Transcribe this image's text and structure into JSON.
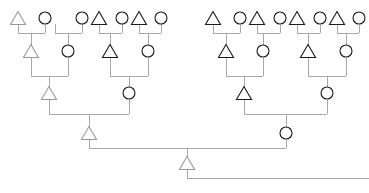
{
  "diagram": {
    "type": "pedigree-family-tree",
    "canvas": {
      "width": 369,
      "height": 193,
      "background": "#ffffff"
    },
    "style": {
      "line_color": "#a8a8a8",
      "node_stroke_dark": "#1a1a1a",
      "node_stroke_light": "#9a9a9a",
      "node_fill": "#ffffff",
      "circle_radius": 6,
      "triangle_size": 13,
      "line_width": 1
    },
    "legend": {
      "circle_meaning": "circle-node",
      "triangle_meaning": "triangle-node"
    },
    "generations": [
      {
        "index": 0,
        "label": "generation-1-top",
        "y": 18
      },
      {
        "index": 1,
        "label": "generation-2",
        "y": 51
      },
      {
        "index": 2,
        "label": "generation-3",
        "y": 93
      },
      {
        "index": 3,
        "label": "generation-4-root",
        "y": 133
      }
    ],
    "nodes": [
      {
        "id": "n1",
        "shape": "triangle",
        "x": 18,
        "y": 18,
        "generation": 0,
        "tone": "light"
      },
      {
        "id": "n2",
        "shape": "circle",
        "x": 45,
        "y": 18,
        "generation": 0,
        "tone": "dark"
      },
      {
        "id": "n3",
        "shape": "circle",
        "x": 82,
        "y": 18,
        "generation": 0,
        "tone": "dark"
      },
      {
        "id": "n4",
        "shape": "triangle",
        "x": 99,
        "y": 18,
        "generation": 0,
        "tone": "dark"
      },
      {
        "id": "n5",
        "shape": "circle",
        "x": 122,
        "y": 18,
        "generation": 0,
        "tone": "dark"
      },
      {
        "id": "n6",
        "shape": "triangle",
        "x": 139,
        "y": 18,
        "generation": 0,
        "tone": "dark"
      },
      {
        "id": "n7",
        "shape": "circle",
        "x": 161,
        "y": 18,
        "generation": 0,
        "tone": "dark"
      },
      {
        "id": "n8",
        "shape": "triangle",
        "x": 213,
        "y": 18,
        "generation": 0,
        "tone": "dark"
      },
      {
        "id": "n9",
        "shape": "circle",
        "x": 240,
        "y": 18,
        "generation": 0,
        "tone": "dark"
      },
      {
        "id": "n10",
        "shape": "triangle",
        "x": 257,
        "y": 18,
        "generation": 0,
        "tone": "dark"
      },
      {
        "id": "n11",
        "shape": "circle",
        "x": 280,
        "y": 18,
        "generation": 0,
        "tone": "dark"
      },
      {
        "id": "n12",
        "shape": "triangle",
        "x": 297,
        "y": 18,
        "generation": 0,
        "tone": "dark"
      },
      {
        "id": "n13",
        "shape": "circle",
        "x": 320,
        "y": 18,
        "generation": 0,
        "tone": "dark"
      },
      {
        "id": "n14",
        "shape": "triangle",
        "x": 337,
        "y": 18,
        "generation": 0,
        "tone": "dark"
      },
      {
        "id": "n15",
        "shape": "circle",
        "x": 359,
        "y": 18,
        "generation": 0,
        "tone": "dark"
      },
      {
        "id": "m1",
        "shape": "triangle",
        "x": 31,
        "y": 51,
        "generation": 1,
        "tone": "light"
      },
      {
        "id": "m2",
        "shape": "circle",
        "x": 68,
        "y": 51,
        "generation": 1,
        "tone": "dark"
      },
      {
        "id": "m3",
        "shape": "triangle",
        "x": 110,
        "y": 51,
        "generation": 1,
        "tone": "dark"
      },
      {
        "id": "m4",
        "shape": "circle",
        "x": 148,
        "y": 51,
        "generation": 1,
        "tone": "dark"
      },
      {
        "id": "m5",
        "shape": "triangle",
        "x": 226,
        "y": 51,
        "generation": 1,
        "tone": "dark"
      },
      {
        "id": "m6",
        "shape": "circle",
        "x": 263,
        "y": 51,
        "generation": 1,
        "tone": "dark"
      },
      {
        "id": "m7",
        "shape": "triangle",
        "x": 308,
        "y": 51,
        "generation": 1,
        "tone": "dark"
      },
      {
        "id": "m8",
        "shape": "circle",
        "x": 346,
        "y": 51,
        "generation": 1,
        "tone": "dark"
      },
      {
        "id": "g1",
        "shape": "triangle",
        "x": 49,
        "y": 93,
        "generation": 2,
        "tone": "light"
      },
      {
        "id": "g2",
        "shape": "circle",
        "x": 129,
        "y": 93,
        "generation": 2,
        "tone": "dark"
      },
      {
        "id": "g3",
        "shape": "triangle",
        "x": 244,
        "y": 93,
        "generation": 2,
        "tone": "dark"
      },
      {
        "id": "g4",
        "shape": "circle",
        "x": 327,
        "y": 93,
        "generation": 2,
        "tone": "dark"
      },
      {
        "id": "r1",
        "shape": "triangle",
        "x": 89,
        "y": 133,
        "generation": 3,
        "tone": "light"
      },
      {
        "id": "r2",
        "shape": "circle",
        "x": 286,
        "y": 133,
        "generation": 3,
        "tone": "dark"
      },
      {
        "id": "root",
        "shape": "triangle",
        "x": 187,
        "y": 163,
        "generation": 4,
        "tone": "light"
      }
    ],
    "unions": [
      {
        "id": "u1",
        "parents": [
          "n1",
          "n2"
        ],
        "child": "m1",
        "bar_y": 33,
        "left_x": 18,
        "right_x": 45,
        "child_x": 31
      },
      {
        "id": "u2",
        "parents": [
          "n3",
          "n4"
        ],
        "child": "m2",
        "bar_y": 33,
        "left_x": 55,
        "right_x": 82,
        "child_x": 68
      },
      {
        "id": "u3",
        "parents": [
          "n5",
          "n6"
        ],
        "child": "m3",
        "bar_y": 33,
        "left_x": 99,
        "right_x": 122,
        "child_x": 110
      },
      {
        "id": "u4",
        "parents": [
          "n7"
        ],
        "child": "m4",
        "bar_y": 33,
        "left_x": 139,
        "right_x": 161,
        "child_x": 148
      },
      {
        "id": "u5",
        "parents": [
          "n8",
          "n9"
        ],
        "child": "m5",
        "bar_y": 33,
        "left_x": 213,
        "right_x": 240,
        "child_x": 226
      },
      {
        "id": "u6",
        "parents": [
          "n10",
          "n11"
        ],
        "child": "m6",
        "bar_y": 33,
        "left_x": 257,
        "right_x": 280,
        "child_x": 263
      },
      {
        "id": "u7",
        "parents": [
          "n12",
          "n13"
        ],
        "child": "m7",
        "bar_y": 33,
        "left_x": 297,
        "right_x": 320,
        "child_x": 308
      },
      {
        "id": "u8",
        "parents": [
          "n14",
          "n15"
        ],
        "child": "m8",
        "bar_y": 33,
        "left_x": 337,
        "right_x": 359,
        "child_x": 346
      },
      {
        "id": "u9",
        "parents": [
          "m1",
          "m2"
        ],
        "child": "g1",
        "bar_y": 76,
        "left_x": 31,
        "right_x": 68,
        "child_x": 49
      },
      {
        "id": "u10",
        "parents": [
          "m3",
          "m4"
        ],
        "child": "g2",
        "bar_y": 76,
        "left_x": 110,
        "right_x": 148,
        "child_x": 129
      },
      {
        "id": "u11",
        "parents": [
          "m5",
          "m6"
        ],
        "child": "g3",
        "bar_y": 76,
        "left_x": 226,
        "right_x": 263,
        "child_x": 244
      },
      {
        "id": "u12",
        "parents": [
          "m7",
          "m8"
        ],
        "child": "g4",
        "bar_y": 76,
        "left_x": 308,
        "right_x": 346,
        "child_x": 327
      },
      {
        "id": "u13",
        "parents": [
          "g1",
          "g2"
        ],
        "child": "r1",
        "bar_y": 114,
        "left_x": 49,
        "right_x": 129,
        "child_x": 89
      },
      {
        "id": "u14",
        "parents": [
          "g3",
          "g4"
        ],
        "child": "r2",
        "bar_y": 114,
        "left_x": 244,
        "right_x": 327,
        "child_x": 286
      },
      {
        "id": "u15",
        "parents": [
          "r1",
          "r2"
        ],
        "child": "root",
        "bar_y": 148,
        "left_x": 89,
        "right_x": 286,
        "child_x": 187
      }
    ],
    "tail": {
      "description": "root-descendant-line",
      "from_x": 187,
      "corner_y": 178,
      "to_x": 369
    }
  }
}
